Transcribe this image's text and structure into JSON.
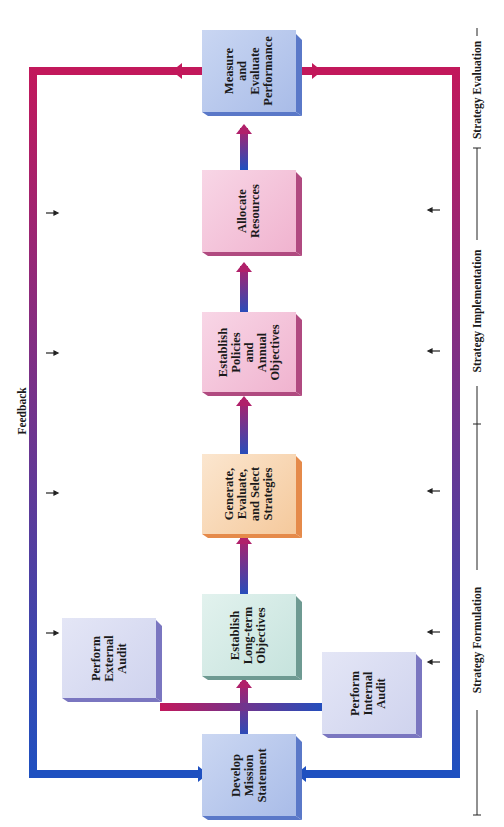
{
  "diagram": {
    "title": "Feedback",
    "boxes": [
      {
        "id": "mission",
        "label": "Develop\nMission\nStatement",
        "color": "#b9c8ec"
      },
      {
        "id": "external",
        "label": "Perform\nExternal\nAudit",
        "color": "#d6daf2"
      },
      {
        "id": "internal",
        "label": "Perform\nInternal\nAudit",
        "color": "#d6daf2"
      },
      {
        "id": "longterm",
        "label": "Establish\nLong-term\nObjectives",
        "color": "#d3ebe6"
      },
      {
        "id": "strategies",
        "label": "Generate,\nEvaluate,\nand Select\nStrategies",
        "color": "#f7d9b8"
      },
      {
        "id": "policies",
        "label": "Establish\nPolicies\nand\nAnnual\nObjectives",
        "color": "#f4c5da"
      },
      {
        "id": "resources",
        "label": "Allocate\nResources",
        "color": "#f4c5da"
      },
      {
        "id": "measure",
        "label": "Measure\nand\nEvaluate\nPerformance",
        "color": "#b9c8ec"
      }
    ],
    "phases": [
      {
        "label": "Strategy Formulation"
      },
      {
        "label": "Strategy Implementation"
      },
      {
        "label": "Strategy Evaluation"
      }
    ],
    "colors": {
      "feedback_magenta": "#c2185b",
      "feedback_blue": "#1e50c0",
      "ink": "#1a1a1a"
    }
  }
}
